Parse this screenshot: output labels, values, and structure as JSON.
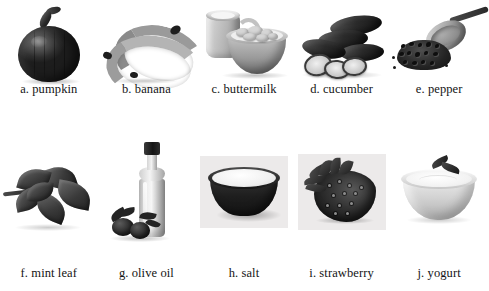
{
  "figure": {
    "type": "labeled-photo-grid",
    "columns": 5,
    "rows": 2,
    "background_color": "#ffffff",
    "label_color": "#141414",
    "panel_color": "#eceaea"
  },
  "items": [
    {
      "key": "pumpkin",
      "letter": "a.",
      "name": "pumpkin",
      "caption": "a. pumpkin",
      "row": 1,
      "col": 1,
      "has_panel": false
    },
    {
      "key": "banana",
      "letter": "b.",
      "name": "banana",
      "caption": "b. banana",
      "row": 1,
      "col": 2,
      "has_panel": false
    },
    {
      "key": "buttermilk",
      "letter": "c.",
      "name": "buttermilk",
      "caption": "c. buttermilk",
      "row": 1,
      "col": 3,
      "has_panel": false
    },
    {
      "key": "cucumber",
      "letter": "d.",
      "name": "cucumber",
      "caption": "d. cucumber",
      "row": 1,
      "col": 4,
      "has_panel": false
    },
    {
      "key": "pepper",
      "letter": "e.",
      "name": "pepper",
      "caption": "e. pepper",
      "row": 1,
      "col": 5,
      "has_panel": false
    },
    {
      "key": "mint-leaf",
      "letter": "f.",
      "name": "mint leaf",
      "caption": "f. mint leaf",
      "row": 2,
      "col": 1,
      "has_panel": false
    },
    {
      "key": "olive-oil",
      "letter": "g.",
      "name": "olive oil",
      "caption": "g. olive oil",
      "row": 2,
      "col": 2,
      "has_panel": false
    },
    {
      "key": "salt",
      "letter": "h.",
      "name": "salt",
      "caption": "h. salt",
      "row": 2,
      "col": 3,
      "has_panel": true
    },
    {
      "key": "strawberry",
      "letter": "i.",
      "name": "strawberry",
      "caption": "i. strawberry",
      "row": 2,
      "col": 4,
      "has_panel": true
    },
    {
      "key": "yogurt",
      "letter": "j.",
      "name": "yogurt",
      "caption": "j. yogurt",
      "row": 2,
      "col": 5,
      "has_panel": false
    }
  ]
}
